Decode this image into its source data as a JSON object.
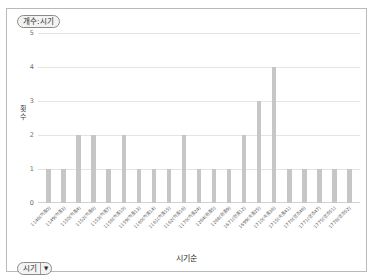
{
  "legend": {
    "label": "개수:시기"
  },
  "axis": {
    "y_title_chars": [
      "횟",
      "수"
    ],
    "y_ticks": [
      "5",
      "4",
      "3",
      "2",
      "1",
      "0"
    ],
    "x_title": "시기순"
  },
  "field_button": {
    "label": "시기",
    "caret": "▼"
  },
  "chart_data": {
    "type": "bar",
    "title": "개수:시기",
    "xlabel": "시기순",
    "ylabel": "횟수",
    "ylim": [
      0,
      5
    ],
    "grid": true,
    "legend_position": "top-left",
    "bar_color": "#c6c6c6",
    "categories": [
      "1146(의종0)",
      "1149(의종3)",
      "1150(의종4)",
      "1152(의종6)",
      "1153(의종7)",
      "1156(의종10)",
      "1159(의종13)",
      "1160(의종14)",
      "1161(의종15)",
      "1162(의종16)",
      "1170(의종24)",
      "1264(원종5)",
      "1268(원종9)",
      "1671(현종12)",
      "1699(숙종25)",
      "1710(숙종36)",
      "1715(숙종41)",
      "1770(영조46)",
      "1771(영조47)",
      "1775(영조51)",
      "1776(영조52)"
    ],
    "values": [
      1,
      1,
      2,
      2,
      1,
      2,
      1,
      1,
      1,
      2,
      1,
      1,
      1,
      2,
      3,
      4,
      1,
      1,
      1,
      1,
      1
    ]
  }
}
